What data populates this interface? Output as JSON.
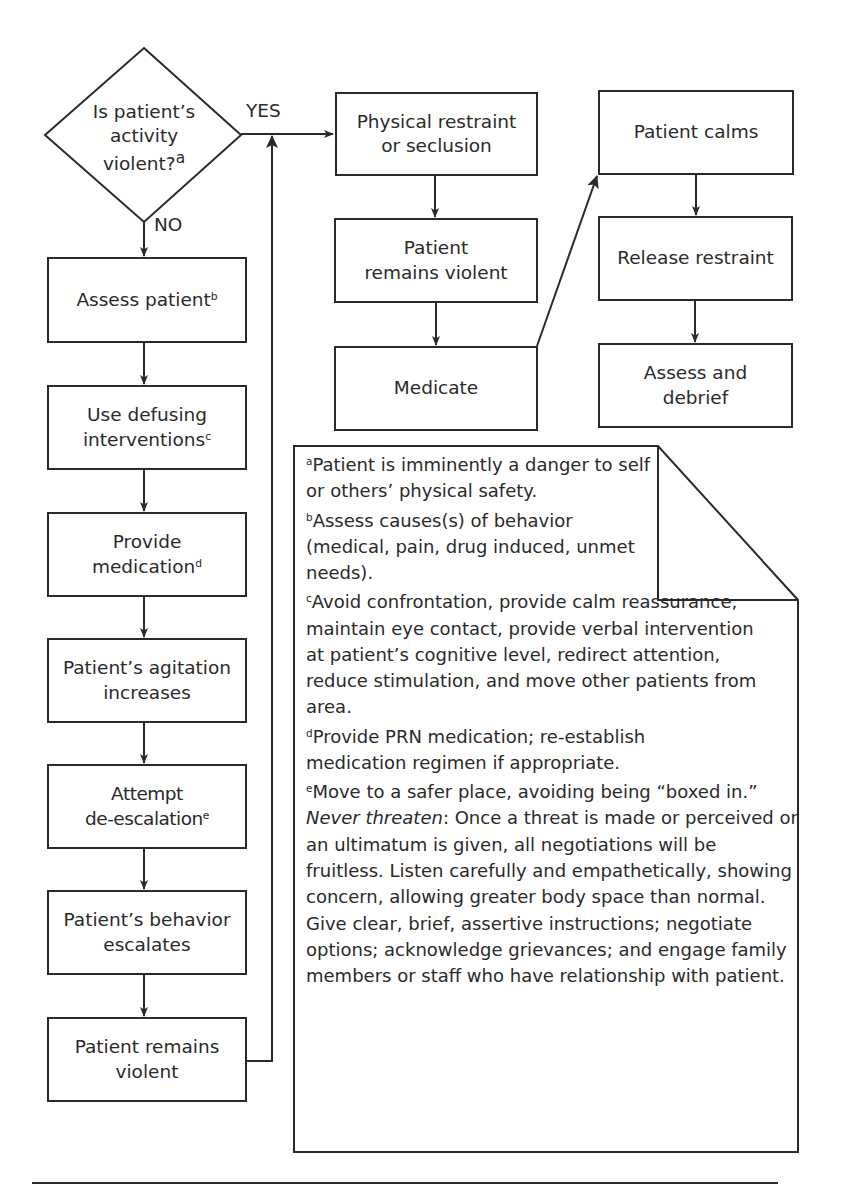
{
  "flowchart": {
    "decision": {
      "text": "Is patient's activity violent?",
      "line1": "Is patient’s",
      "line2": "activity",
      "line3": "violent?",
      "footnote_ref": "a",
      "yes_label": "YES",
      "no_label": "NO"
    },
    "left_column": [
      {
        "id": "assess-patient",
        "line1": "Assess patient",
        "line2": "",
        "footnote_ref": "b"
      },
      {
        "id": "use-defusing",
        "line1": "Use defusing",
        "line2": "interventions",
        "footnote_ref": "c"
      },
      {
        "id": "provide-medication",
        "line1": "Provide",
        "line2": "medication",
        "footnote_ref": "d"
      },
      {
        "id": "agitation-increases",
        "line1": "Patient’s agitation",
        "line2": "increases",
        "footnote_ref": ""
      },
      {
        "id": "attempt-deescalation",
        "line1": "Attempt",
        "line2": "de-escalation",
        "footnote_ref": "e"
      },
      {
        "id": "behavior-escalates",
        "line1": "Patient’s behavior",
        "line2": "escalates",
        "footnote_ref": ""
      },
      {
        "id": "remains-violent-left",
        "line1": "Patient remains",
        "line2": "violent",
        "footnote_ref": ""
      }
    ],
    "middle_column": [
      {
        "id": "physical-restraint",
        "line1": "Physical restraint",
        "line2": "or seclusion"
      },
      {
        "id": "remains-violent-mid",
        "line1": "Patient",
        "line2": "remains violent"
      },
      {
        "id": "medicate",
        "line1": "Medicate",
        "line2": ""
      }
    ],
    "right_column": [
      {
        "id": "patient-calms",
        "line1": "Patient calms",
        "line2": ""
      },
      {
        "id": "release-restraint",
        "line1": "Release restraint",
        "line2": ""
      },
      {
        "id": "assess-debrief",
        "line1": "Assess and",
        "line2": "debrief"
      }
    ]
  },
  "footnotes": {
    "a": {
      "marker": "a",
      "text": "Patient is imminently a danger to self or others’ physical safety."
    },
    "b": {
      "marker": "b",
      "text": "Assess causes(s) of behavior (medical, pain, drug induced, unmet needs)."
    },
    "c": {
      "marker": "c",
      "text": "Avoid confrontation, provide calm reassurance, maintain eye contact, provide verbal intervention at patient’s cognitive level, redirect attention, reduce stimulation, and move other patients from area."
    },
    "d": {
      "marker": "d",
      "text": "Provide PRN medication; re-establish medication regimen if appropriate."
    },
    "e": {
      "marker": "e",
      "text_before": "Move to a safer place, avoiding being “boxed in.” ",
      "emphasis": "Never threaten",
      "text_after": ": Once a threat is made or perceived or an ultimatum is given, all negotiations will be fruitless. Listen carefully and empathetically, showing concern, allowing greater body space than normal. Give clear, brief, assertive instructions; negotiate options; acknowledge grievances; and engage family members or staff who have relationship with patient."
    }
  },
  "colors": {
    "stroke": "#2a2a2a",
    "background": "#ffffff"
  }
}
